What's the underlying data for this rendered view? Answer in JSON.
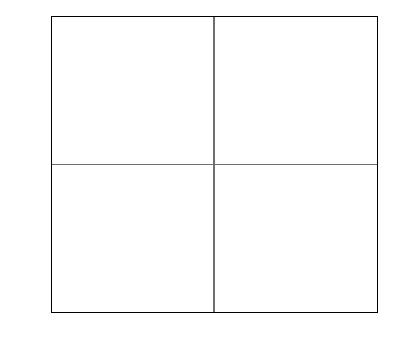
{
  "chart_data": {
    "type": "scatter",
    "title": "",
    "xlabel": "",
    "ylabel": "",
    "xlim": [
      -2.5,
      2.5
    ],
    "ylim": [
      -2.25,
      2.25
    ],
    "grid": false,
    "legend": null,
    "axis_lines_at_origin": true,
    "xticks": [
      "-2.50",
      "-2.00",
      "-1.50",
      "-1.00",
      "-0.50",
      "0",
      "0.50",
      "1.00",
      "1.50",
      "2.00",
      "2.50"
    ],
    "xtick_values": [
      -2.5,
      -2.0,
      -1.5,
      -1.0,
      -0.5,
      0,
      0.5,
      1.0,
      1.5,
      2.0,
      2.5
    ],
    "yticks": [
      "2.00",
      "1.50",
      "1.00",
      "0.50",
      "0",
      "-0.50",
      "-1.00",
      "-1.50",
      "-2.00"
    ],
    "ytick_values": [
      2.0,
      1.5,
      1.0,
      0.5,
      0,
      -0.5,
      -1.0,
      -1.5,
      -2.0
    ],
    "points": [
      {
        "label": "Formic Acid",
        "x": -1.57,
        "y": 0.99,
        "label_side": "right"
      },
      {
        "label": "Acetic Acid",
        "x": -1.62,
        "y": 0.81,
        "label_side": "right"
      },
      {
        "label": "Butanethiol",
        "x": -1.98,
        "y": 0.0,
        "label_side": "leader-up"
      },
      {
        "label": "Propyl Sulfide",
        "x": -1.8,
        "y": -0.09,
        "label_side": "right"
      },
      {
        "label": "Nitropropane",
        "x": -0.84,
        "y": -0.98,
        "label_side": "left"
      },
      {
        "label": "Pentanoic Acid (valeric)",
        "x": -0.18,
        "y": -1.39,
        "label_side": "leader-left"
      },
      {
        "label": "Salicylaldehyde",
        "x": -0.28,
        "y": -1.51,
        "label_side": "leader-left"
      },
      {
        "label": "Methyl Acetate",
        "x": 0.36,
        "y": 1.17,
        "label_side": "leader-upleft"
      },
      {
        "label": "t-Butanol",
        "x": 0.47,
        "y": 1.17,
        "label_side": "leader-right"
      },
      {
        "label": "Ethyl Acetate",
        "x": 0.54,
        "y": 1.0,
        "label_side": "leader-right"
      },
      {
        "label": "Acetone",
        "x": 0.62,
        "y": 0.99,
        "label_side": "leader-right"
      },
      {
        "label": "2-Pentanone",
        "x": 0.7,
        "y": 0.98,
        "label_side": "leader-right"
      },
      {
        "label": "Propyl Acetate",
        "x": 0.74,
        "y": 0.9,
        "label_side": "leader-right"
      },
      {
        "label": "1,2 Dichloroethane",
        "x": 0.72,
        "y": 0.77,
        "label_side": "leader-right"
      },
      {
        "label": "2-Ethoxyethylacetate",
        "x": 1.14,
        "y": -0.58,
        "label_side": "leader-upleft"
      },
      {
        "label": "3-Heptanone",
        "x": 1.08,
        "y": -0.75,
        "label_side": "right"
      },
      {
        "label": "Butanol",
        "x": 0.71,
        "y": -0.84,
        "label_side": "leader-right"
      },
      {
        "label": "Anisole",
        "x": 0.4,
        "y": -1.07,
        "label_side": "right"
      },
      {
        "label": "1,3,5-Trimethylbenzene",
        "x": 0.17,
        "y": -1.51,
        "label_side": "right"
      }
    ]
  },
  "axes": {
    "x_labels": [
      "-2.50",
      "-2.00",
      "-1.50",
      "-1.00",
      "-0.50",
      "0",
      "0.50",
      "1.00",
      "1.50",
      "2.00",
      "2.50"
    ],
    "y_labels": [
      "2.00",
      "1.50",
      "1.00",
      "0.50",
      "0",
      "-0.50",
      "-1.00",
      "-1.50",
      "-2.00"
    ]
  },
  "labels": {
    "formic_acid": "Formic Acid",
    "acetic_acid": "Acetic Acid",
    "butanethiol": "Butanethiol",
    "propyl_sulfide": "Propyl Sulfide",
    "nitropropane": "Nitropropane",
    "pentanoic_acid": "Pentanoic Acid (valeric)",
    "salicylaldehyde": "Salicylaldehyde",
    "methyl_acetate": "Methyl Acetate",
    "t_butanol": "t-Butanol",
    "ethyl_acetate": "Ethyl Acetate",
    "acetone": "Acetone",
    "two_pentanone": "2-Pentanone",
    "propyl_acetate": "Propyl Acetate",
    "dichloroethane": "1,2 Dichloroethane",
    "ethoxyethylacetate": "2-Ethoxyethylacetate",
    "heptanone": "3-Heptanone",
    "butanol": "Butanol",
    "anisole": "Anisole",
    "trimethylbenzene": "1,3,5-Trimethylbenzene"
  },
  "colors": {
    "point": "#000000",
    "frame": "#000000",
    "axis": "#6e6e6e",
    "background": "#ffffff"
  }
}
